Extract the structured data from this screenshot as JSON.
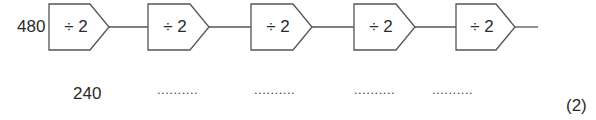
{
  "diagram": {
    "start_value": "480",
    "operators": [
      {
        "label": "÷ 2"
      },
      {
        "label": "÷ 2"
      },
      {
        "label": "÷ 2"
      },
      {
        "label": "÷ 2"
      },
      {
        "label": "÷ 2"
      }
    ],
    "results": [
      {
        "value": "240"
      },
      {
        "value": ".........."
      },
      {
        "value": ".........."
      },
      {
        "value": ".........."
      },
      {
        "value": ".........."
      }
    ],
    "marks": "(2)"
  }
}
